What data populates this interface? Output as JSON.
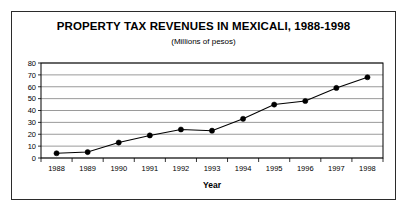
{
  "figure": {
    "title": "PROPERTY TAX REVENUES IN MEXICALI, 1988-1998",
    "subtitle": "(Millions of pesos)"
  },
  "chart_data": {
    "type": "line",
    "title": "PROPERTY TAX REVENUES IN MEXICALI, 1988-1998",
    "subtitle": "(Millions of pesos)",
    "xlabel": "Year",
    "ylabel": "",
    "categories": [
      "1988",
      "1989",
      "1990",
      "1991",
      "1992",
      "1993",
      "1994",
      "1995",
      "1996",
      "1997",
      "1998"
    ],
    "values": [
      4,
      5,
      13,
      19,
      24,
      23,
      33,
      45,
      48,
      59,
      68
    ],
    "series": [
      {
        "name": "Property tax revenues",
        "values": [
          4,
          5,
          13,
          19,
          24,
          23,
          33,
          45,
          48,
          59,
          68
        ]
      }
    ],
    "ylim": [
      0,
      80
    ],
    "yticks": [
      0,
      10,
      20,
      30,
      40,
      50,
      60,
      70,
      80
    ],
    "ytick_labels": [
      "0",
      "10",
      "20",
      "30",
      "40",
      "50",
      "60",
      "70",
      "80"
    ],
    "grid": true,
    "grid_axis": "y",
    "legend": false,
    "marker": "circle",
    "line_color": "#000000",
    "marker_color": "#000000",
    "background_color": "#ffffff",
    "frame_color": "#2b2b2b"
  }
}
